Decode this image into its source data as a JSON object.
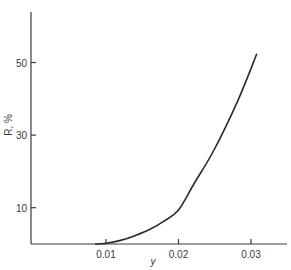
{
  "chart_data": {
    "type": "line",
    "title": "",
    "xlabel": "y",
    "ylabel": "R, %",
    "xlim": [
      0.0,
      0.035
    ],
    "ylim": [
      0,
      60
    ],
    "x_ticks": [
      0.01,
      0.02,
      0.03
    ],
    "x_tick_labels": [
      "0.01",
      "0.02",
      "0.03"
    ],
    "y_ticks": [
      10,
      30,
      50
    ],
    "y_tick_labels": [
      "10",
      "30",
      "50"
    ],
    "grid": false,
    "legend": null,
    "series": [
      {
        "name": "R vs y",
        "x": [
          0.0085,
          0.01,
          0.012,
          0.014,
          0.016,
          0.018,
          0.02,
          0.0222,
          0.0249,
          0.0282,
          0.0308
        ],
        "y": [
          0,
          0.2,
          1.0,
          2.3,
          4.0,
          6.3,
          9.4,
          16.8,
          25.9,
          39.6,
          52.4
        ]
      }
    ],
    "colors": {
      "axis": "#3a3a3a",
      "line": "#2a2a2a",
      "background": "#ffffff"
    }
  },
  "layout": {
    "origin_px": [
      31,
      244
    ],
    "x_ref_value": 0.01,
    "x_ref_px": 106,
    "px_per_x_unit": 7250,
    "px_per_y_unit": 3.63,
    "x_axis_end_px": 287,
    "y_axis_top_px": 12
  }
}
